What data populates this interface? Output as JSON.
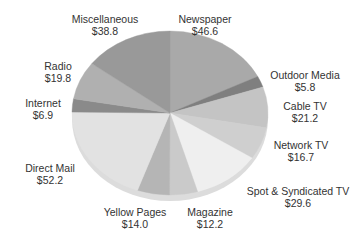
{
  "chart_data": {
    "type": "pie",
    "title": "",
    "unit": "$",
    "start_angle_deg": 0,
    "direction": "clockwise",
    "slices": [
      {
        "label": "Newspaper",
        "value": 46.6,
        "display": "$46.6",
        "color": "#a9a9a9",
        "lx": 205,
        "ly": 13
      },
      {
        "label": "Outdoor Media",
        "value": 5.8,
        "display": "$5.8",
        "color": "#7f7f7f",
        "lx": 305,
        "ly": 69
      },
      {
        "label": "Cable TV",
        "value": 21.2,
        "display": "$21.2",
        "color": "#c4c4c4",
        "lx": 305,
        "ly": 100
      },
      {
        "label": "Network TV",
        "value": 16.7,
        "display": "$16.7",
        "color": "#cfcfcf",
        "lx": 301,
        "ly": 139
      },
      {
        "label": "Spot & Syndicated TV",
        "value": 29.6,
        "display": "$29.6",
        "color": "#efefef",
        "lx": 298,
        "ly": 185
      },
      {
        "label": "Magazine",
        "value": 12.2,
        "display": "$12.2",
        "color": "#cacaca",
        "lx": 210,
        "ly": 206
      },
      {
        "label": "Yellow Pages",
        "value": 14.0,
        "display": "$14.0",
        "color": "#b5b5b5",
        "lx": 135,
        "ly": 206
      },
      {
        "label": "Direct Mail",
        "value": 52.2,
        "display": "$52.2",
        "color": "#e2e2e2",
        "lx": 50,
        "ly": 162
      },
      {
        "label": "Internet",
        "value": 6.9,
        "display": "$6.9",
        "color": "#8a8a8a",
        "lx": 43,
        "ly": 97
      },
      {
        "label": "Radio",
        "value": 19.8,
        "display": "$19.8",
        "color": "#b0b0b0",
        "lx": 58,
        "ly": 60
      },
      {
        "label": "Miscellaneous",
        "value": 38.8,
        "display": "$38.8",
        "color": "#999999",
        "lx": 105,
        "ly": 13
      }
    ],
    "total": 263.8,
    "legend": "none (labels placed around pie)"
  }
}
